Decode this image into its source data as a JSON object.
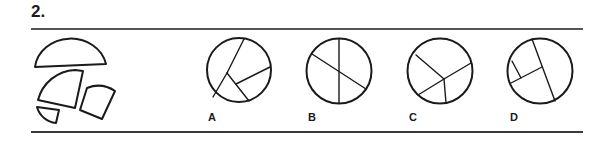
{
  "question": {
    "number": "2.",
    "pieces": [
      "semicircle",
      "large-sector",
      "trapezoid-sector",
      "small-wedge"
    ],
    "options": [
      {
        "label": "A",
        "description": "circle divided by branching lines into four regions"
      },
      {
        "label": "B",
        "description": "circle with vertical diameter and diagonal line"
      },
      {
        "label": "C",
        "description": "circle with four radial lines from off-center point"
      },
      {
        "label": "D",
        "description": "circle with chord and perpendicular segments"
      }
    ]
  },
  "colors": {
    "stroke": "#1a1a1a",
    "rule": "#3a3a3a",
    "background": "#ffffff"
  }
}
